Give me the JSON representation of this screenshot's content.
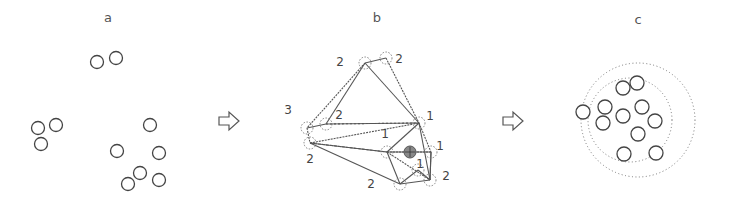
{
  "figure": {
    "panels": [
      {
        "id": "a",
        "label": "a",
        "label_pos": [
          108,
          22
        ]
      },
      {
        "id": "b",
        "label": "b",
        "label_pos": [
          377,
          22
        ]
      },
      {
        "id": "c",
        "label": "c",
        "label_pos": [
          638,
          24
        ]
      }
    ],
    "arrows": [
      {
        "name": "arrow-a-to-b",
        "x": 219,
        "y": 121
      },
      {
        "name": "arrow-b-to-c",
        "x": 503,
        "y": 121
      }
    ],
    "panel_a": {
      "circles": [
        [
          97,
          62
        ],
        [
          116,
          58
        ],
        [
          38,
          128
        ],
        [
          56,
          125
        ],
        [
          41,
          144
        ],
        [
          150,
          125
        ],
        [
          117,
          151
        ],
        [
          159,
          153
        ],
        [
          140,
          173
        ],
        [
          128,
          184
        ],
        [
          159,
          180
        ]
      ],
      "radius": 6.5
    },
    "panel_b": {
      "nodes": [
        {
          "x": 365,
          "y": 63,
          "label": "2",
          "lx": 340,
          "ly": 66
        },
        {
          "x": 386,
          "y": 58,
          "label": "2",
          "lx": 399,
          "ly": 63
        },
        {
          "x": 307,
          "y": 128,
          "label": "3",
          "lx": 288,
          "ly": 114
        },
        {
          "x": 326,
          "y": 124,
          "label": "2",
          "lx": 339,
          "ly": 119
        },
        {
          "x": 310,
          "y": 143,
          "label": "2",
          "lx": 310,
          "ly": 163
        },
        {
          "x": 419,
          "y": 123,
          "label": "1",
          "lx": 430,
          "ly": 120
        },
        {
          "x": 387,
          "y": 152,
          "label": "1",
          "lx": 385,
          "ly": 138
        },
        {
          "x": 431,
          "y": 152,
          "label": "1",
          "lx": 440,
          "ly": 150
        },
        {
          "x": 418,
          "y": 170,
          "label": "1",
          "lx": 420,
          "ly": 168
        },
        {
          "x": 400,
          "y": 184,
          "label": "2",
          "lx": 371,
          "ly": 188
        },
        {
          "x": 430,
          "y": 180,
          "label": "2",
          "lx": 446,
          "ly": 180
        }
      ],
      "shaded_node": {
        "x": 410,
        "y": 152
      },
      "edges": [
        [
          0,
          2
        ],
        [
          0,
          3
        ],
        [
          0,
          5
        ],
        [
          1,
          5
        ],
        [
          0,
          1
        ],
        [
          2,
          3
        ],
        [
          2,
          4
        ],
        [
          3,
          5
        ],
        [
          4,
          6
        ],
        [
          4,
          5
        ],
        [
          4,
          9
        ],
        [
          6,
          5
        ],
        [
          6,
          10
        ],
        [
          6,
          9
        ],
        [
          5,
          10
        ],
        [
          5,
          7
        ],
        [
          7,
          10
        ],
        [
          9,
          10
        ],
        [
          6,
          7
        ],
        [
          8,
          9
        ],
        [
          8,
          10
        ]
      ]
    },
    "panel_c": {
      "circles": [
        [
          623,
          88
        ],
        [
          637,
          83
        ],
        [
          583,
          112
        ],
        [
          605,
          107
        ],
        [
          603,
          123
        ],
        [
          623,
          116
        ],
        [
          642,
          107
        ],
        [
          655,
          121
        ],
        [
          638,
          134
        ],
        [
          624,
          154
        ],
        [
          656,
          153
        ]
      ],
      "radius": 7,
      "outer_ring": {
        "cx": 638,
        "cy": 120,
        "r": 57
      },
      "inner_ring": {
        "cx": 630,
        "cy": 120,
        "r": 42
      }
    }
  }
}
